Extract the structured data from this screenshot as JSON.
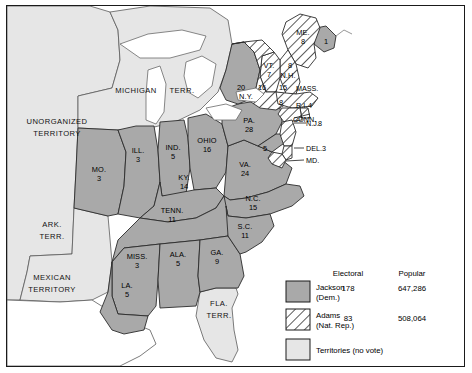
{
  "map": {
    "title": "Election of 1828",
    "colors": {
      "jackson": "#a9a9a9",
      "adams_hatch_bg": "#ffffff",
      "adams_hatch_line": "#3a3a3a",
      "territory": "#e6e6e6",
      "water": "#ffffff",
      "border": "#1a1a1a",
      "outline": "#444444"
    },
    "territories": [
      {
        "name": "unorganized-territory",
        "label_line1": "UNORGANIZED",
        "label_line2": "TERRITORY"
      },
      {
        "name": "michigan-territory",
        "label_line1": "MICHIGAN",
        "label_line2": "TERR."
      },
      {
        "name": "arkansas-territory",
        "label_line1": "ARK.",
        "label_line2": "TERR."
      },
      {
        "name": "mexican-territory",
        "label_line1": "MEXICAN",
        "label_line2": "TERRITORY"
      },
      {
        "name": "florida-territory",
        "label_line1": "FLA.",
        "label_line2": "TERR."
      }
    ],
    "states": [
      {
        "name": "missouri",
        "label": "MO.",
        "votes": "3",
        "party": "jackson"
      },
      {
        "name": "illinois",
        "label": "ILL.",
        "votes": "3",
        "party": "jackson"
      },
      {
        "name": "indiana",
        "label": "IND.",
        "votes": "5",
        "party": "jackson"
      },
      {
        "name": "ohio",
        "label": "OHIO",
        "votes": "16",
        "party": "jackson"
      },
      {
        "name": "kentucky",
        "label": "KY.",
        "votes": "14",
        "party": "jackson"
      },
      {
        "name": "tennessee",
        "label": "TENN.",
        "votes": "11",
        "party": "jackson"
      },
      {
        "name": "mississippi",
        "label": "MISS.",
        "votes": "3",
        "party": "jackson"
      },
      {
        "name": "alabama",
        "label": "ALA.",
        "votes": "5",
        "party": "jackson"
      },
      {
        "name": "georgia",
        "label": "GA.",
        "votes": "9",
        "party": "jackson"
      },
      {
        "name": "louisiana",
        "label": "LA.",
        "votes": "5",
        "party": "jackson"
      },
      {
        "name": "virginia",
        "label": "VA.",
        "votes": "24",
        "party": "jackson"
      },
      {
        "name": "north-carolina",
        "label": "N.C.",
        "votes": "15",
        "party": "jackson"
      },
      {
        "name": "south-carolina",
        "label": "S.C.",
        "votes": "11",
        "party": "jackson"
      },
      {
        "name": "pennsylvania",
        "label": "PA.",
        "votes": "28",
        "party": "jackson"
      },
      {
        "name": "maryland",
        "label": "MD.",
        "votes": "5",
        "party": "split"
      },
      {
        "name": "delaware",
        "label": "DEL.",
        "votes": "3",
        "party": "adams"
      },
      {
        "name": "new-jersey",
        "label": "N.J.",
        "votes": "8",
        "party": "adams"
      },
      {
        "name": "new-york",
        "label": "N.Y.",
        "votes_jackson": "20",
        "votes_adams": "16",
        "party": "split"
      },
      {
        "name": "connecticut",
        "label": "CONN.",
        "votes": "8",
        "party": "adams"
      },
      {
        "name": "rhode-island",
        "label": "R.I.",
        "votes": "4",
        "party": "adams"
      },
      {
        "name": "massachusetts",
        "label": "MASS.",
        "votes": "15",
        "party": "adams"
      },
      {
        "name": "new-hampshire",
        "label": "N.H.",
        "votes": "8",
        "party": "adams"
      },
      {
        "name": "vermont",
        "label": "VT.",
        "votes": "7",
        "party": "adams"
      },
      {
        "name": "maine",
        "label": "ME.",
        "votes_adams": "8",
        "votes_jackson": "1",
        "party": "split"
      }
    ]
  },
  "legend": {
    "columns": {
      "electoral": "Electoral",
      "popular": "Popular"
    },
    "rows": [
      {
        "name": "jackson",
        "label_line1": "Jackson",
        "label_line2": "(Dem.)",
        "electoral": "178",
        "popular": "647,286",
        "swatch": "solid"
      },
      {
        "name": "adams",
        "label_line1": "Adams",
        "label_line2": "(Nat. Rep.)",
        "electoral": "83",
        "popular": "508,064",
        "swatch": "hatched"
      },
      {
        "name": "territories",
        "label_line1": "Territories (no vote)",
        "label_line2": "",
        "electoral": "",
        "popular": "",
        "swatch": "light"
      }
    ]
  }
}
